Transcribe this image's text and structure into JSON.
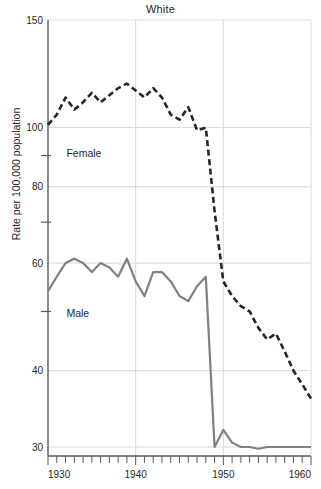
{
  "chart_data": {
    "type": "line",
    "title": "White",
    "xlabel": "",
    "ylabel": "Rate per 100,000 population",
    "yscale": "log",
    "ylim": [
      29,
      150
    ],
    "xlim": [
      1930,
      1960
    ],
    "grid": true,
    "legend_position": "inline-annotation",
    "y_major_ticks": [
      150,
      100,
      80,
      60,
      40,
      30
    ],
    "y_minor_ticks": [
      90,
      70,
      50
    ],
    "x_major_ticks": [
      1930,
      1940,
      1950,
      1960
    ],
    "x_minor_tick_step": 1,
    "x": [
      1930,
      1931,
      1932,
      1933,
      1934,
      1935,
      1936,
      1937,
      1938,
      1939,
      1940,
      1941,
      1942,
      1943,
      1944,
      1945,
      1946,
      1947,
      1948,
      1949,
      1950,
      1951,
      1952,
      1953,
      1954,
      1955,
      1956,
      1957,
      1958,
      1959,
      1960
    ],
    "series": [
      {
        "name": "Female",
        "style": "dashed",
        "color": "#262626",
        "values": [
          101,
          105,
          112,
          107,
          110,
          114,
          110,
          113,
          116,
          118,
          115,
          112,
          116,
          112,
          105,
          103,
          108,
          99,
          100,
          73,
          56,
          53,
          51,
          50,
          47,
          45,
          46,
          43,
          40,
          38,
          36
        ]
      },
      {
        "name": "Male",
        "style": "solid",
        "color": "#808080",
        "values": [
          54,
          57,
          60,
          61,
          60,
          58,
          60,
          59,
          57,
          61,
          56,
          53,
          58,
          58,
          56,
          53,
          52,
          55,
          57,
          30,
          32,
          30.5,
          30,
          30,
          29.8,
          30,
          30,
          30,
          30,
          30,
          30
        ]
      }
    ],
    "annotations": [
      {
        "text": "Female",
        "x": 1932.1,
        "y": 89.5
      },
      {
        "text": "Male",
        "x": 1932.1,
        "y": 49.0
      }
    ],
    "colors": {
      "axis": "#595959",
      "grid": "#d9d9d9",
      "female_line": "#262626",
      "male_line": "#808080",
      "text": "#1f1f1f",
      "background": "#ffffff"
    }
  }
}
